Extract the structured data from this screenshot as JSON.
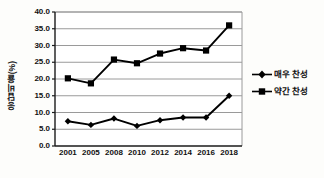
{
  "chart_data": {
    "type": "line",
    "title": "",
    "xlabel": "",
    "ylabel": "응답비율(%)",
    "categories": [
      "2001",
      "2005",
      "2008",
      "2010",
      "2012",
      "2014",
      "2016",
      "2018"
    ],
    "ylim": [
      0.0,
      40.0
    ],
    "ytick_labels": [
      "0.0",
      "5.0",
      "10.0",
      "15.0",
      "20.0",
      "25.0",
      "30.0",
      "35.0",
      "40.0"
    ],
    "ytick_values": [
      0.0,
      5.0,
      10.0,
      15.0,
      20.0,
      25.0,
      30.0,
      35.0,
      40.0
    ],
    "grid": true,
    "legend_position": "right",
    "series": [
      {
        "name": "매우 찬성",
        "marker": "diamond",
        "color": "#000000",
        "values": [
          7.4,
          6.3,
          8.2,
          6.0,
          7.7,
          8.5,
          8.5,
          15.0
        ]
      },
      {
        "name": "약간 찬성",
        "marker": "square",
        "color": "#000000",
        "values": [
          20.2,
          18.7,
          25.8,
          24.7,
          27.6,
          29.2,
          28.5,
          36.0
        ]
      }
    ]
  },
  "legend": {
    "items": [
      {
        "label": "매우 찬성",
        "marker": "diamond"
      },
      {
        "label": "약간 찬성",
        "marker": "square"
      }
    ]
  },
  "colors": {
    "background": "#fdfdfb",
    "plot_background": "#ffffff",
    "axis": "#1a1a1a",
    "grid": "#9a9a9a",
    "series": "#000000",
    "text": "#111111"
  }
}
